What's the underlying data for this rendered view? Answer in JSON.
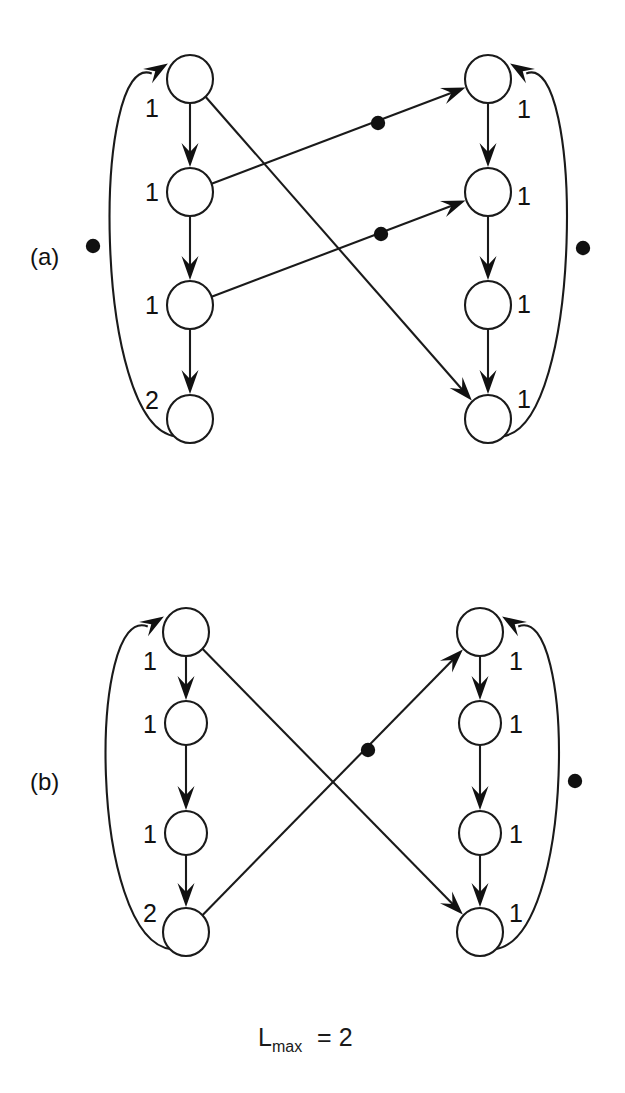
{
  "figure": {
    "type": "petri-net-marked-graph",
    "background_color": "#ffffff",
    "ink_color": "#111111",
    "width": 625,
    "height": 1093,
    "caption": {
      "base": "L",
      "subscript": "max",
      "relation": "=",
      "value": "2",
      "full_text": "Lmax = 2"
    },
    "panels": [
      {
        "id": "a",
        "label": "(a)",
        "label_x": 30,
        "label_y": 265,
        "places": [
          {
            "id": "aL1",
            "cx": 190,
            "cy": 79,
            "rx": 23,
            "ry": 24,
            "weight": "1",
            "label_x": 152,
            "label_y": 117,
            "label_anchor": "middle"
          },
          {
            "id": "aL2",
            "cx": 190,
            "cy": 192,
            "rx": 23,
            "ry": 24,
            "weight": "1",
            "label_x": 152,
            "label_y": 201,
            "label_anchor": "middle"
          },
          {
            "id": "aL3",
            "cx": 190,
            "cy": 305,
            "rx": 23,
            "ry": 24,
            "weight": "1",
            "label_x": 152,
            "label_y": 314,
            "label_anchor": "middle"
          },
          {
            "id": "aL4",
            "cx": 190,
            "cy": 419,
            "rx": 23,
            "ry": 24,
            "weight": "2",
            "label_x": 152,
            "label_y": 409,
            "label_anchor": "middle"
          },
          {
            "id": "aR1",
            "cx": 488,
            "cy": 79,
            "rx": 23,
            "ry": 24,
            "weight": "1",
            "label_x": 524,
            "label_y": 118,
            "label_anchor": "middle"
          },
          {
            "id": "aR2",
            "cx": 488,
            "cy": 192,
            "rx": 23,
            "ry": 24,
            "weight": "1",
            "label_x": 524,
            "label_y": 205,
            "label_anchor": "middle"
          },
          {
            "id": "aR3",
            "cx": 488,
            "cy": 305,
            "rx": 23,
            "ry": 24,
            "weight": "1",
            "label_x": 524,
            "label_y": 313,
            "label_anchor": "middle"
          },
          {
            "id": "aR4",
            "cx": 488,
            "cy": 419,
            "rx": 23,
            "ry": 24,
            "weight": "1",
            "label_x": 524,
            "label_y": 408,
            "label_anchor": "middle"
          }
        ],
        "edges": [
          {
            "id": "aL1-aL2",
            "kind": "straight",
            "from": "aL1",
            "to": "aL2",
            "tokens": 0
          },
          {
            "id": "aL2-aL3",
            "kind": "straight",
            "from": "aL2",
            "to": "aL3",
            "tokens": 0
          },
          {
            "id": "aL3-aL4",
            "kind": "straight",
            "from": "aL3",
            "to": "aL4",
            "tokens": 0
          },
          {
            "id": "aR1-aR2",
            "kind": "straight",
            "from": "aR1",
            "to": "aR2",
            "tokens": 0
          },
          {
            "id": "aR2-aR3",
            "kind": "straight",
            "from": "aR2",
            "to": "aR3",
            "tokens": 0
          },
          {
            "id": "aR3-aR4",
            "kind": "straight",
            "from": "aR3",
            "to": "aR4",
            "tokens": 0
          },
          {
            "id": "aL2-aR1",
            "kind": "straight",
            "from": "aL2",
            "to": "aR1",
            "tokens": 1,
            "token_points": [
              [
                378,
                123
              ]
            ]
          },
          {
            "id": "aL3-aR2",
            "kind": "straight",
            "from": "aL3",
            "to": "aR2",
            "tokens": 1,
            "token_points": [
              [
                381,
                234
              ]
            ]
          },
          {
            "id": "aL1-aR4",
            "kind": "straight",
            "from": "aL1",
            "to": "aR4",
            "tokens": 0
          },
          {
            "id": "aL4-aL1",
            "kind": "arc-left",
            "from": "aL4",
            "to": "aL1",
            "tokens": 1,
            "token_points": [
              [
                93,
                246
              ]
            ]
          },
          {
            "id": "aR4-aR1",
            "kind": "arc-right",
            "from": "aR4",
            "to": "aR1",
            "tokens": 1,
            "token_points": [
              [
                583,
                248
              ]
            ]
          }
        ]
      },
      {
        "id": "b",
        "label": "(b)",
        "label_x": 30,
        "label_y": 790,
        "places": [
          {
            "id": "bL1",
            "cx": 186,
            "cy": 632,
            "rx": 23,
            "ry": 24,
            "weight": "1",
            "label_x": 150,
            "label_y": 670,
            "label_anchor": "middle"
          },
          {
            "id": "bL2",
            "cx": 186,
            "cy": 723,
            "rx": 21,
            "ry": 22,
            "weight": "1",
            "label_x": 150,
            "label_y": 733,
            "label_anchor": "middle"
          },
          {
            "id": "bL3",
            "cx": 186,
            "cy": 833,
            "rx": 21,
            "ry": 22,
            "weight": "1",
            "label_x": 150,
            "label_y": 843,
            "label_anchor": "middle"
          },
          {
            "id": "bL4",
            "cx": 186,
            "cy": 932,
            "rx": 23,
            "ry": 24,
            "weight": "2",
            "label_x": 150,
            "label_y": 922,
            "label_anchor": "middle"
          },
          {
            "id": "bR1",
            "cx": 480,
            "cy": 632,
            "rx": 23,
            "ry": 24,
            "weight": "1",
            "label_x": 516,
            "label_y": 670,
            "label_anchor": "middle"
          },
          {
            "id": "bR2",
            "cx": 480,
            "cy": 723,
            "rx": 21,
            "ry": 22,
            "weight": "1",
            "label_x": 516,
            "label_y": 733,
            "label_anchor": "middle"
          },
          {
            "id": "bR3",
            "cx": 480,
            "cy": 833,
            "rx": 21,
            "ry": 22,
            "weight": "1",
            "label_x": 516,
            "label_y": 843,
            "label_anchor": "middle"
          },
          {
            "id": "bR4",
            "cx": 480,
            "cy": 932,
            "rx": 23,
            "ry": 24,
            "weight": "1",
            "label_x": 516,
            "label_y": 922,
            "label_anchor": "middle"
          }
        ],
        "edges": [
          {
            "id": "bL1-bL2",
            "kind": "straight",
            "from": "bL1",
            "to": "bL2",
            "tokens": 0
          },
          {
            "id": "bL2-bL3",
            "kind": "straight",
            "from": "bL2",
            "to": "bL3",
            "tokens": 0
          },
          {
            "id": "bL3-bL4",
            "kind": "straight",
            "from": "bL3",
            "to": "bL4",
            "tokens": 0
          },
          {
            "id": "bR1-bR2",
            "kind": "straight",
            "from": "bR1",
            "to": "bR2",
            "tokens": 0
          },
          {
            "id": "bR2-bR3",
            "kind": "straight",
            "from": "bR2",
            "to": "bR3",
            "tokens": 0
          },
          {
            "id": "bR3-bR4",
            "kind": "straight",
            "from": "bR3",
            "to": "bR4",
            "tokens": 0
          },
          {
            "id": "bL1-bR4",
            "kind": "straight",
            "from": "bL1",
            "to": "bR4",
            "tokens": 0
          },
          {
            "id": "bL4-bR1",
            "kind": "straight",
            "from": "bL4",
            "to": "bR1",
            "tokens": 1,
            "token_points": [
              [
                368,
                750
              ]
            ]
          },
          {
            "id": "bL4-bL1",
            "kind": "arc-left",
            "from": "bL4",
            "to": "bL1",
            "tokens": 0
          },
          {
            "id": "bR4-bR1",
            "kind": "arc-right",
            "from": "bR4",
            "to": "bR1",
            "tokens": 1,
            "token_points": [
              [
                575,
                781
              ]
            ]
          }
        ]
      }
    ],
    "arc_geometry": {
      "a": {
        "left_bulge": 92,
        "right_bulge": 584
      },
      "b": {
        "left_bulge": 88,
        "right_bulge": 576
      }
    }
  }
}
